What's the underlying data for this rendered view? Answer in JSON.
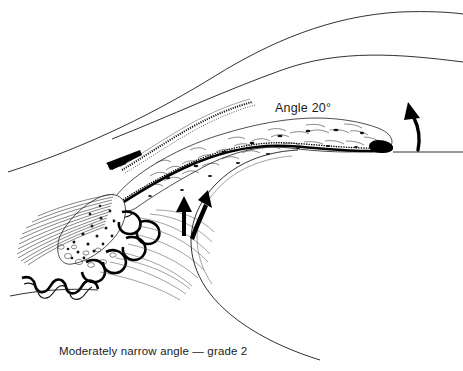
{
  "figure": {
    "kind": "anatomical-line-drawing",
    "background_color": "#ffffff",
    "ink_color": "#111111",
    "width": 463,
    "height": 371
  },
  "annotations": {
    "angle_label": "Angle 20°",
    "caption": "Moderately narrow angle — grade 2"
  },
  "structures": [
    {
      "name": "cornea-outer-surface",
      "label": "Cornea outer surface"
    },
    {
      "name": "cornea-inner-surface",
      "label": "Cornea inner surface"
    },
    {
      "name": "trabecular-meshwork",
      "label": "Trabecular meshwork"
    },
    {
      "name": "schwalbe-line",
      "label": "Schwalbe's line"
    },
    {
      "name": "scleral-spur",
      "label": "Scleral spur"
    },
    {
      "name": "iris-stroma",
      "label": "Iris stroma"
    },
    {
      "name": "iris-pigment-epithelium",
      "label": "Iris pigment epithelium"
    },
    {
      "name": "ciliary-body",
      "label": "Ciliary body"
    },
    {
      "name": "ciliary-processes",
      "label": "Ciliary processes"
    },
    {
      "name": "ciliary-muscle",
      "label": "Ciliary muscle"
    },
    {
      "name": "zonular-fibres",
      "label": "Zonular fibres"
    },
    {
      "name": "lens-capsule",
      "label": "Lens capsule"
    },
    {
      "name": "angle-reference-line",
      "label": "Angle reference line"
    }
  ],
  "arrows": [
    {
      "name": "aqueous-flow-arrow-left",
      "direction": "up"
    },
    {
      "name": "aqueous-flow-arrow-right",
      "direction": "up-right"
    },
    {
      "name": "outflow-curved-arrow",
      "direction": "curved-up-left"
    }
  ]
}
